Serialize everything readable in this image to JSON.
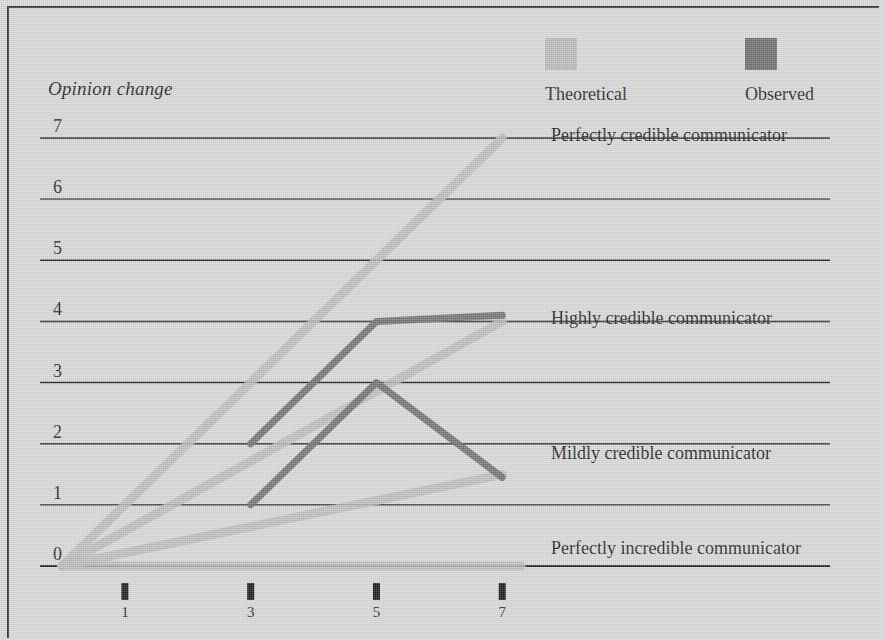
{
  "axis_title": "Opinion change",
  "legend": {
    "items": [
      {
        "label": "Theoretical",
        "color": "#b6b6b6",
        "swatch_name": "theoretical-swatch"
      },
      {
        "label": "Observed",
        "color": "#6a6a6a",
        "swatch_name": "observed-swatch"
      }
    ]
  },
  "row_labels": [
    {
      "text": "Perfectly credible communicator",
      "y": 7
    },
    {
      "text": "Highly credible communicator",
      "y": 4
    },
    {
      "text": "Mildly credible communicator",
      "y": 1.8
    },
    {
      "text": "Perfectly incredible communicator",
      "y": 0.25
    }
  ],
  "chart_data": {
    "type": "line",
    "title": "",
    "xlabel": "",
    "ylabel": "Opinion change",
    "xlim": [
      0,
      7.6
    ],
    "ylim": [
      0,
      7
    ],
    "xticks": [
      1,
      3,
      5,
      7
    ],
    "yticks": [
      0,
      1,
      2,
      3,
      4,
      5,
      6,
      7
    ],
    "grid": true,
    "legend_position": "top-right",
    "series": [
      {
        "name": "Theoretical - perfectly credible",
        "group": "Theoretical",
        "color": "#b6b6b6",
        "x": [
          0,
          7
        ],
        "y": [
          0,
          7
        ]
      },
      {
        "name": "Theoretical - highly credible",
        "group": "Theoretical",
        "color": "#b6b6b6",
        "x": [
          0,
          7
        ],
        "y": [
          0,
          4
        ]
      },
      {
        "name": "Theoretical - mildly credible",
        "group": "Theoretical",
        "color": "#b6b6b6",
        "x": [
          0,
          7
        ],
        "y": [
          0,
          1.5
        ]
      },
      {
        "name": "Theoretical - perfectly incredible",
        "group": "Theoretical",
        "color": "#b6b6b6",
        "x": [
          0,
          7.3
        ],
        "y": [
          0,
          0
        ]
      },
      {
        "name": "Observed - highly credible",
        "group": "Observed",
        "color": "#6a6a6a",
        "x": [
          3,
          5,
          7
        ],
        "y": [
          2,
          4,
          4.1
        ]
      },
      {
        "name": "Observed - mildly credible",
        "group": "Observed",
        "color": "#6a6a6a",
        "x": [
          3,
          5,
          7
        ],
        "y": [
          1,
          3,
          1.45
        ]
      }
    ]
  }
}
